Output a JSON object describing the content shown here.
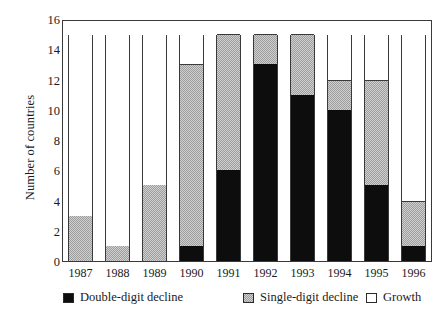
{
  "chart_data": {
    "type": "bar",
    "subtype": "stacked-bar",
    "title": "",
    "xlabel": "",
    "ylabel": "Number of countries",
    "ylim": [
      0,
      16
    ],
    "ytick_step": 2,
    "yticks": [
      0,
      2,
      4,
      6,
      8,
      10,
      12,
      14,
      16
    ],
    "ytick_labels": [
      "0",
      "2",
      "4",
      "6",
      "8",
      "10",
      "12",
      "14",
      "16"
    ],
    "grid": false,
    "legend_position": "bottom",
    "categories": [
      "1987",
      "1988",
      "1989",
      "1990",
      "1991",
      "1992",
      "1993",
      "1994",
      "1995",
      "1996"
    ],
    "series": [
      {
        "name": "Double-digit decline",
        "color": "#0d0d0d",
        "values": [
          0,
          0,
          0,
          1,
          6,
          13,
          11,
          10,
          5,
          1
        ]
      },
      {
        "name": "Single-digit decline",
        "color": "#c4c4c4",
        "values": [
          3,
          1,
          5,
          12,
          9,
          2,
          4,
          2,
          7,
          3
        ]
      },
      {
        "name": "Growth",
        "color": "#ffffff",
        "values": [
          12,
          14,
          10,
          2,
          0,
          0,
          0,
          3,
          3,
          11
        ]
      }
    ],
    "bar_totals": [
      15,
      15,
      15,
      15,
      15,
      15,
      15,
      15,
      15,
      15
    ]
  },
  "legend": {
    "items": [
      {
        "label": "Double-digit decline",
        "swatch": "double-digit-swatch"
      },
      {
        "label": "Single-digit decline",
        "swatch": "single-digit-swatch"
      },
      {
        "label": "Growth",
        "swatch": "growth-swatch"
      }
    ]
  },
  "axes": {
    "y_title": "Number of countries"
  }
}
